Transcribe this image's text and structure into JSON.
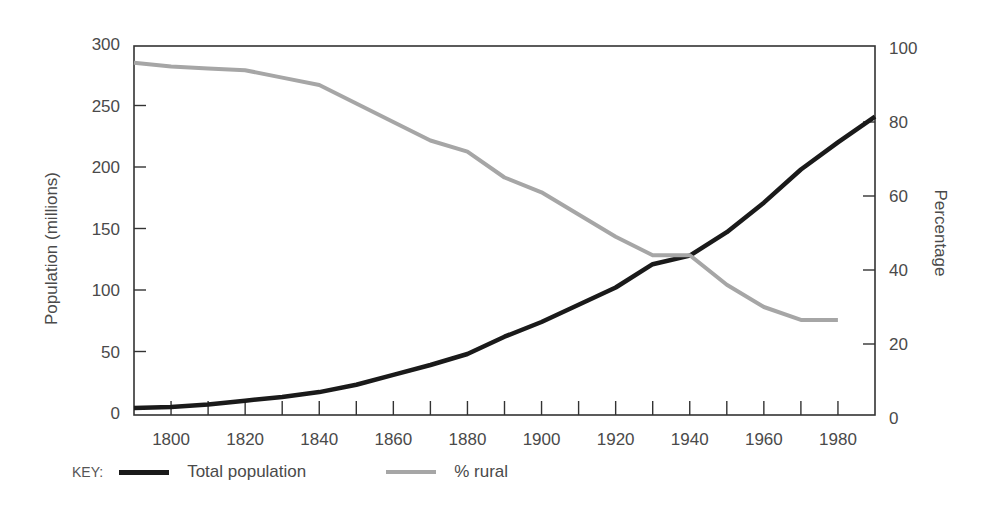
{
  "chart_data": {
    "type": "line",
    "title": "",
    "xlabel": "",
    "ylabel": "Population (millions)",
    "ylabel_right": "Percentage",
    "x": [
      1790,
      1800,
      1810,
      1820,
      1830,
      1840,
      1850,
      1860,
      1870,
      1880,
      1890,
      1900,
      1910,
      1920,
      1930,
      1940,
      1950,
      1960,
      1970,
      1980,
      1990
    ],
    "xlim": [
      1790,
      1990
    ],
    "ylim": [
      0,
      300
    ],
    "ylim_right": [
      0,
      100
    ],
    "x_ticks": [
      1800,
      1810,
      1820,
      1830,
      1840,
      1850,
      1860,
      1870,
      1880,
      1890,
      1900,
      1910,
      1920,
      1930,
      1940,
      1950,
      1960,
      1970,
      1980
    ],
    "x_tick_labels": [
      "1800",
      "1820",
      "1840",
      "1860",
      "1880",
      "1900",
      "1920",
      "1940",
      "1960",
      "1980"
    ],
    "y_tick_labels": [
      "0",
      "50",
      "100",
      "150",
      "200",
      "250",
      "300"
    ],
    "y_right_tick_labels": [
      "0",
      "20",
      "40",
      "60",
      "80",
      "100"
    ],
    "grid": false,
    "legend_position": "bottom",
    "series": [
      {
        "name": "Total population",
        "axis": "left",
        "color": "#1a1a1a",
        "values": [
          4,
          5,
          7,
          10,
          13,
          17,
          23,
          31,
          39,
          48,
          62,
          74,
          88,
          102,
          121,
          128,
          147,
          171,
          198,
          220,
          241
        ]
      },
      {
        "name": "% rural",
        "axis": "right",
        "color": "#a6a6a6",
        "values": [
          96,
          95,
          94.5,
          94,
          92,
          90,
          85,
          80,
          75,
          72,
          65,
          61,
          55,
          49,
          44,
          44,
          36,
          30,
          26.5,
          26.5,
          null
        ]
      }
    ]
  },
  "legend": {
    "key_label": "KEY:",
    "items": [
      {
        "label": "Total population",
        "color": "#1a1a1a"
      },
      {
        "label": "% rural",
        "color": "#a6a6a6"
      }
    ]
  }
}
